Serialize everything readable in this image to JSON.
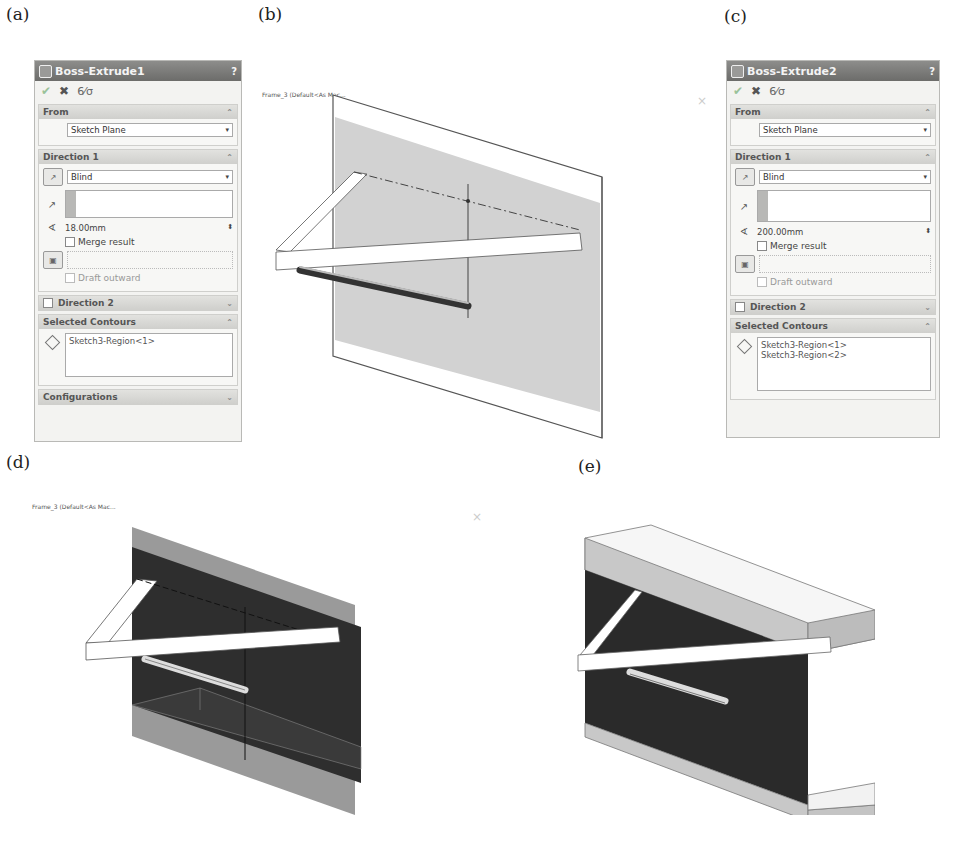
{
  "figure_labels": {
    "a": "(a)",
    "b": "(b)",
    "c": "(c)",
    "d": "(d)",
    "e": "(e)"
  },
  "panel_a": {
    "title": "Boss-Extrude1",
    "help": "?",
    "actions": {
      "ok": "✔",
      "cancel": "✖",
      "detail": "6⁄σ"
    },
    "from": {
      "header": "From",
      "value": "Sketch Plane"
    },
    "direction1": {
      "header": "Direction 1",
      "end_condition": "Blind",
      "depth": "18.00mm",
      "merge_result": "Merge result",
      "draft_outward": "Draft outward"
    },
    "direction2": {
      "header": "Direction 2"
    },
    "selected_contours": {
      "header": "Selected Contours",
      "items": [
        "Sketch3-Region<1>"
      ]
    },
    "configurations": {
      "header": "Configurations"
    }
  },
  "panel_c": {
    "title": "Boss-Extrude2",
    "help": "?",
    "actions": {
      "ok": "✔",
      "cancel": "✖",
      "detail": "6⁄σ"
    },
    "from": {
      "header": "From",
      "value": "Sketch Plane"
    },
    "direction1": {
      "header": "Direction 1",
      "end_condition": "Blind",
      "depth": "200.00mm",
      "merge_result": "Merge result",
      "draft_outward": "Draft outward"
    },
    "direction2": {
      "header": "Direction 2"
    },
    "selected_contours": {
      "header": "Selected Contours",
      "items": [
        "Sketch3-Region<1>",
        "Sketch3-Region<2>"
      ]
    }
  },
  "viewport_b": {
    "tree_label": "Frame_3 (Default<As Mac..."
  },
  "viewport_d": {
    "tree_label": "Frame_3 (Default<As Mac..."
  },
  "icons": {
    "collapse": "⌃",
    "expand": "⌄",
    "dropdown": "▾",
    "spin": "⬍",
    "faint_x": "×"
  },
  "colors": {
    "title_bar": "#7c7c7a",
    "panel_bg": "#f3f3f1",
    "plane_light": "#cfcfcf",
    "plane_dark": "#2b2b2b",
    "flange": "#d8d8d8"
  }
}
